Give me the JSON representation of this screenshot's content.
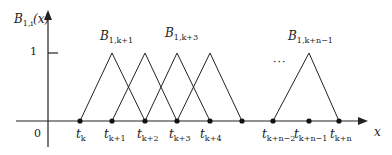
{
  "diagram": {
    "y_axis_label": {
      "main": "B",
      "sub": "1,i",
      "arg": "(x)"
    },
    "x_axis_label": "x",
    "origin_label": "0",
    "y_tick_label": "1",
    "ellipsis": "···",
    "basis_labels": [
      {
        "main": "B",
        "sub": "1,k+1"
      },
      {
        "main": "B",
        "sub": "1,k+3"
      },
      {
        "main": "B",
        "sub": "1,k+n−1"
      }
    ],
    "knots": [
      {
        "main": "t",
        "sub": "k"
      },
      {
        "main": "t",
        "sub": "k+1"
      },
      {
        "main": "t",
        "sub": "k+2"
      },
      {
        "main": "t",
        "sub": "k+3"
      },
      {
        "main": "t",
        "sub": "k+4"
      },
      {
        "main": "t",
        "sub": "k+n−2"
      },
      {
        "main": "t",
        "sub": "k+n−1"
      },
      {
        "main": "t",
        "sub": "k+n"
      }
    ],
    "colors": {
      "line": "#222222"
    }
  }
}
